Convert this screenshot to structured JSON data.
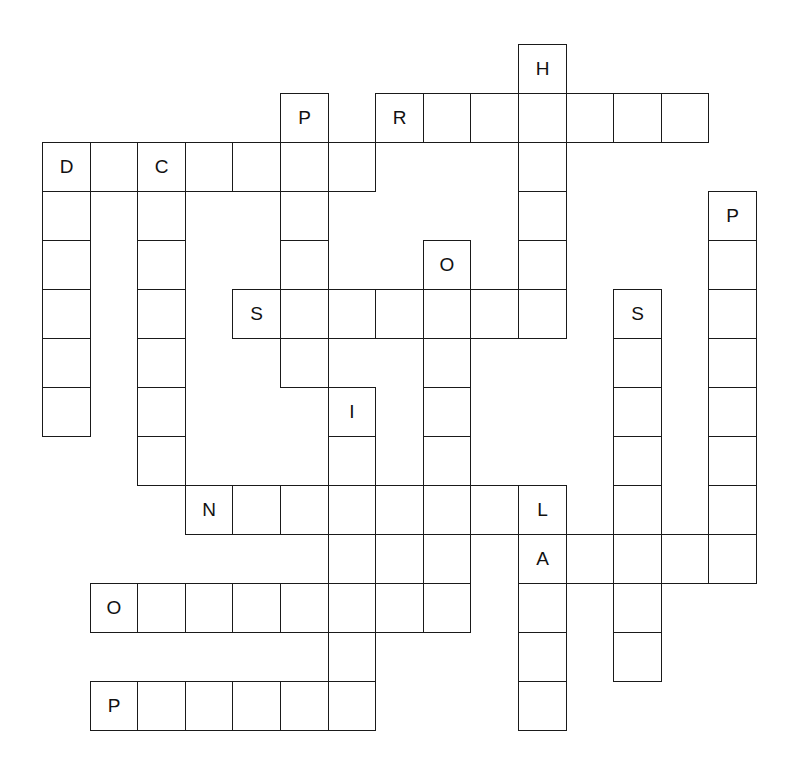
{
  "puzzle": {
    "type": "crossword",
    "grid": {
      "origin_x": 42,
      "origin_y": 44,
      "cell_width": 47.6,
      "cell_height": 49,
      "border_color": "#1a1a1a",
      "letter_color": "#111111"
    },
    "words": [
      {
        "id": "H-down",
        "start_letter": "H",
        "direction": "down",
        "row": 0,
        "col": 10,
        "length": 6
      },
      {
        "id": "R-across",
        "start_letter": "R",
        "direction": "across",
        "row": 1,
        "col": 7,
        "length": 7
      },
      {
        "id": "P-down-top",
        "start_letter": "P",
        "direction": "down",
        "row": 1,
        "col": 5,
        "length": 6
      },
      {
        "id": "D-across",
        "start_letter": "D",
        "direction": "across",
        "row": 2,
        "col": 0,
        "length": 7
      },
      {
        "id": "D-down",
        "start_letter": "D",
        "direction": "down",
        "row": 2,
        "col": 0,
        "length": 6
      },
      {
        "id": "C-down",
        "start_letter": "C",
        "direction": "down",
        "row": 2,
        "col": 2,
        "length": 7
      },
      {
        "id": "P-down-right",
        "start_letter": "P",
        "direction": "down",
        "row": 3,
        "col": 14,
        "length": 8
      },
      {
        "id": "O-down",
        "start_letter": "O",
        "direction": "down",
        "row": 4,
        "col": 8,
        "length": 8
      },
      {
        "id": "S-across",
        "start_letter": "S",
        "direction": "across",
        "row": 5,
        "col": 4,
        "length": 7
      },
      {
        "id": "S-down",
        "start_letter": "S",
        "direction": "down",
        "row": 5,
        "col": 12,
        "length": 8
      },
      {
        "id": "I-down",
        "start_letter": "I",
        "direction": "down",
        "row": 7,
        "col": 6,
        "length": 7
      },
      {
        "id": "N-across",
        "start_letter": "N",
        "direction": "across",
        "row": 9,
        "col": 3,
        "length": 8
      },
      {
        "id": "L-down",
        "start_letter": "L",
        "direction": "down",
        "row": 9,
        "col": 10,
        "length": 5
      },
      {
        "id": "A-across",
        "start_letter": "A",
        "direction": "across",
        "row": 10,
        "col": 10,
        "length": 5
      },
      {
        "id": "O-across",
        "start_letter": "O",
        "direction": "across",
        "row": 11,
        "col": 1,
        "length": 8
      },
      {
        "id": "P-across-bottom",
        "start_letter": "P",
        "direction": "across",
        "row": 13,
        "col": 1,
        "length": 6
      }
    ]
  }
}
